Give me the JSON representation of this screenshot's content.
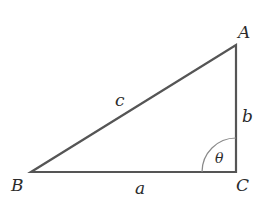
{
  "diagram": {
    "type": "right-triangle",
    "vertices": {
      "A": {
        "label": "A",
        "x": 236,
        "y": 45
      },
      "B": {
        "label": "B",
        "x": 31,
        "y": 172
      },
      "C": {
        "label": "C",
        "x": 236,
        "y": 172
      }
    },
    "sides": {
      "a": {
        "label": "a",
        "between": [
          "B",
          "C"
        ]
      },
      "b": {
        "label": "b",
        "between": [
          "C",
          "A"
        ]
      },
      "c": {
        "label": "c",
        "between": [
          "B",
          "A"
        ]
      }
    },
    "angle": {
      "label": "θ",
      "at": "C"
    },
    "colors": {
      "line": "#555555",
      "arc": "#8a8a8a",
      "text": "#2b2b2b"
    }
  }
}
